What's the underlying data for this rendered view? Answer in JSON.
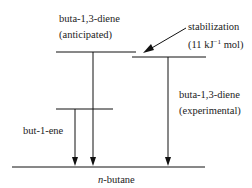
{
  "diagram": {
    "type": "energy-level-diagram",
    "levels": {
      "anticipated": {
        "label_line1": "buta-1,3-diene",
        "label_line2": "(anticipated)"
      },
      "experimental": {
        "label_line1": "buta-1,3-diene",
        "label_line2": "(experimental)"
      },
      "butene": {
        "label": "but-1-ene"
      },
      "butane": {
        "label_italic": "n",
        "label_rest": "-butane"
      }
    },
    "stabilization": {
      "label_line1": "stabilization",
      "label_line2_pre": "(11 kJ",
      "label_line2_sup": "−1",
      "label_line2_post": " mol)"
    },
    "colors": {
      "line": "#111111",
      "text": "#222222"
    }
  }
}
